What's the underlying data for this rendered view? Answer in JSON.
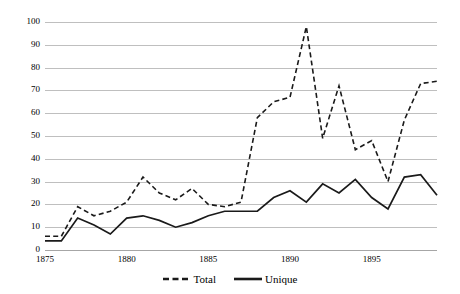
{
  "chart_data": {
    "type": "line",
    "title": "",
    "subtitle": "",
    "xlabel": "",
    "ylabel": "",
    "xlim": [
      1875,
      1899
    ],
    "ylim": [
      0,
      100
    ],
    "grid": true,
    "legend_position": "bottom-center",
    "x": [
      1875,
      1876,
      1877,
      1878,
      1879,
      1880,
      1881,
      1882,
      1883,
      1884,
      1885,
      1886,
      1887,
      1888,
      1889,
      1890,
      1891,
      1892,
      1893,
      1894,
      1895,
      1896,
      1897,
      1898,
      1899
    ],
    "x_ticks": [
      1875,
      1880,
      1885,
      1890,
      1895
    ],
    "x_tick_labels": [
      "1875",
      "1880",
      "1885",
      "1890",
      "1895"
    ],
    "y_ticks": [
      0,
      10,
      20,
      30,
      40,
      50,
      60,
      70,
      80,
      90,
      100
    ],
    "y_tick_labels": [
      "0",
      "10",
      "20",
      "30",
      "40",
      "50",
      "60",
      "70",
      "80",
      "90",
      "100"
    ],
    "series": [
      {
        "name": "Total",
        "style": "dashed",
        "color": "#1a1a1a",
        "values": [
          6,
          6,
          19,
          15,
          17,
          21,
          32,
          25,
          22,
          27,
          20,
          19,
          21,
          58,
          65,
          67,
          98,
          49,
          72,
          44,
          48,
          30,
          57,
          73,
          74
        ]
      },
      {
        "name": "Unique",
        "style": "solid",
        "color": "#1a1a1a",
        "values": [
          4,
          4,
          14,
          11,
          7,
          14,
          15,
          13,
          10,
          12,
          15,
          17,
          17,
          17,
          23,
          26,
          21,
          29,
          25,
          31,
          23,
          18,
          32,
          33,
          24
        ]
      }
    ]
  },
  "legend": {
    "entries": [
      {
        "label": "Total",
        "style": "dashed"
      },
      {
        "label": "Unique",
        "style": "solid"
      }
    ]
  },
  "colors": {
    "gridline": "#bfbfbf",
    "baseline": "#a6a6a6",
    "series_line": "#1a1a1a",
    "background": "#ffffff",
    "text": "#000000"
  }
}
